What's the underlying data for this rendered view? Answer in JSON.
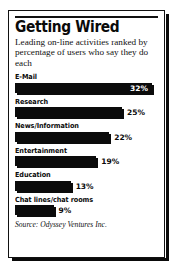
{
  "card": {
    "title": "Getting Wired",
    "subtitle": "Leading on-line activities ranked by percentage of users who say they do each",
    "source": "Source: Odyssey Ventures Inc."
  },
  "colors": {
    "bar": "#0b0b0b",
    "text": "#111111",
    "background": "#ffffff",
    "value_inside": "#ffffff"
  },
  "chart_data": {
    "type": "bar",
    "orientation": "horizontal",
    "title": "Getting Wired",
    "subtitle": "Leading on-line activities ranked by percentage of users who say they do each",
    "xlabel": "",
    "ylabel": "",
    "xlim": [
      0,
      32
    ],
    "grid": false,
    "legend": null,
    "value_suffix": "%",
    "source": "Source: Odyssey Ventures Inc.",
    "categories": [
      "E-Mail",
      "Research",
      "News/Information",
      "Entertainment",
      "Education",
      "Chat lines/chat rooms"
    ],
    "values": [
      32,
      25,
      22,
      19,
      13,
      9
    ],
    "labels": [
      "32%",
      "25%",
      "22%",
      "19%",
      "13%",
      "9%"
    ],
    "label_placement": [
      "inside",
      "outside",
      "outside",
      "outside",
      "outside",
      "outside"
    ]
  }
}
